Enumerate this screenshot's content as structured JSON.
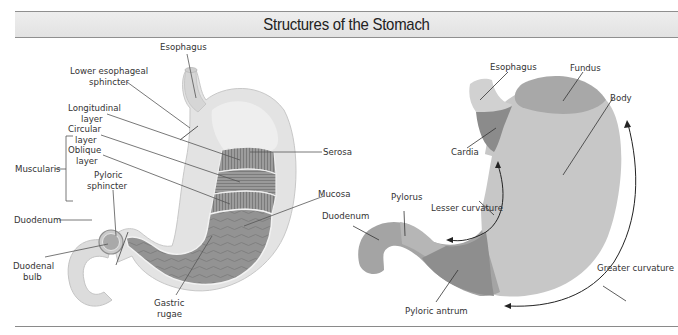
{
  "title": "Structures of the Stomach",
  "left_diagram": {
    "labels": {
      "esophagus": "Esophagus",
      "les_1": "Lower esophageal",
      "les_2": "sphincter",
      "muscularis": "Muscularis",
      "longitudinal_1": "Longitudinal",
      "longitudinal_2": "layer",
      "circular_1": "Circular",
      "circular_2": "layer",
      "oblique_1": "Oblique",
      "oblique_2": "layer",
      "pyloric_1": "Pyloric",
      "pyloric_2": "sphincter",
      "duodenum": "Duodenum",
      "duodenal_bulb_1": "Duodenal",
      "duodenal_bulb_2": "bulb",
      "serosa": "Serosa",
      "mucosa": "Mucosa",
      "gastric_1": "Gastric",
      "gastric_2": "rugae"
    }
  },
  "right_diagram": {
    "labels": {
      "esophagus": "Esophagus",
      "fundus": "Fundus",
      "body": "Body",
      "cardia": "Cardia",
      "pylorus": "Pylorus",
      "lesser_curvature": "Lesser curvature",
      "duodenum": "Duodenum",
      "greater_curvature": "Greater curvature",
      "pyloric_antrum": "Pyloric antrum"
    },
    "region_colors": {
      "esophagus": "#cfcfcf",
      "cardia": "#8a8a8a",
      "fundus": "#a6a6a6",
      "body": "#c6c6c6",
      "pylorus": "#b4b4b4",
      "pyloric_antrum": "#8c8c8c",
      "duodenum": "#a3a3a3"
    }
  }
}
